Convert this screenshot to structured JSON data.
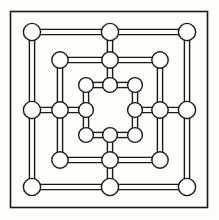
{
  "figure": {
    "background_color": "#fdfdfb",
    "line_color": "#1a1a1a",
    "node_fill_color": "#ffffff",
    "node_stroke_color": "#1a1a1a"
  },
  "frame": {
    "name": "outer-border",
    "x": 10.5,
    "y": 11.5,
    "width": 197,
    "height": 196,
    "stroke_width": 1.6
  },
  "geometry": {
    "stroke_width": 1.4,
    "rail_offset": 2.6,
    "rings": [
      {
        "name": "outer-ring",
        "min": 32,
        "mid": 110,
        "max": 187,
        "node_radius": 8.6
      },
      {
        "name": "middle-ring",
        "min": 60,
        "mid": 110,
        "max": 160,
        "node_radius": 8.2
      },
      {
        "name": "inner-ring",
        "min": 86,
        "mid": 110,
        "max": 135,
        "node_radius": 7.4
      }
    ]
  },
  "nodes": [
    {
      "id": "a1",
      "ring": "outer",
      "position": "top-left",
      "cx": 32,
      "cy": 32,
      "r": 8.6
    },
    {
      "id": "a2",
      "ring": "outer",
      "position": "top-middle",
      "cx": 110,
      "cy": 32,
      "r": 8.6
    },
    {
      "id": "a3",
      "ring": "outer",
      "position": "top-right",
      "cx": 187,
      "cy": 32,
      "r": 8.6
    },
    {
      "id": "a4",
      "ring": "outer",
      "position": "middle-left",
      "cx": 32,
      "cy": 110,
      "r": 8.6
    },
    {
      "id": "a5",
      "ring": "outer",
      "position": "middle-right",
      "cx": 187,
      "cy": 110,
      "r": 8.6
    },
    {
      "id": "a6",
      "ring": "outer",
      "position": "bottom-left",
      "cx": 32,
      "cy": 187,
      "r": 8.6
    },
    {
      "id": "a7",
      "ring": "outer",
      "position": "bottom-middle",
      "cx": 110,
      "cy": 187,
      "r": 8.6
    },
    {
      "id": "a8",
      "ring": "outer",
      "position": "bottom-right",
      "cx": 187,
      "cy": 187,
      "r": 8.6
    },
    {
      "id": "b1",
      "ring": "middle",
      "position": "top-left",
      "cx": 60,
      "cy": 60,
      "r": 8.2
    },
    {
      "id": "b2",
      "ring": "middle",
      "position": "top-middle",
      "cx": 110,
      "cy": 60,
      "r": 8.2
    },
    {
      "id": "b3",
      "ring": "middle",
      "position": "top-right",
      "cx": 160,
      "cy": 60,
      "r": 8.2
    },
    {
      "id": "b4",
      "ring": "middle",
      "position": "middle-left",
      "cx": 60,
      "cy": 110,
      "r": 8.2
    },
    {
      "id": "b5",
      "ring": "middle",
      "position": "middle-right",
      "cx": 160,
      "cy": 110,
      "r": 8.2
    },
    {
      "id": "b6",
      "ring": "middle",
      "position": "bottom-left",
      "cx": 60,
      "cy": 160,
      "r": 8.2
    },
    {
      "id": "b7",
      "ring": "middle",
      "position": "bottom-middle",
      "cx": 110,
      "cy": 160,
      "r": 8.2
    },
    {
      "id": "b8",
      "ring": "middle",
      "position": "bottom-right",
      "cx": 160,
      "cy": 160,
      "r": 8.2
    },
    {
      "id": "c1",
      "ring": "inner",
      "position": "top-left",
      "cx": 86,
      "cy": 85,
      "r": 7.4
    },
    {
      "id": "c2",
      "ring": "inner",
      "position": "top-middle",
      "cx": 110,
      "cy": 85,
      "r": 7.4
    },
    {
      "id": "c3",
      "ring": "inner",
      "position": "top-right",
      "cx": 135,
      "cy": 85,
      "r": 7.4
    },
    {
      "id": "c4",
      "ring": "inner",
      "position": "middle-left",
      "cx": 86,
      "cy": 110,
      "r": 7.4
    },
    {
      "id": "c5",
      "ring": "inner",
      "position": "middle-right",
      "cx": 135,
      "cy": 110,
      "r": 7.4
    },
    {
      "id": "c6",
      "ring": "inner",
      "position": "bottom-left",
      "cx": 86,
      "cy": 135,
      "r": 7.4
    },
    {
      "id": "c7",
      "ring": "inner",
      "position": "bottom-middle",
      "cx": 110,
      "cy": 135,
      "r": 7.4
    },
    {
      "id": "c8",
      "ring": "inner",
      "position": "bottom-right",
      "cx": 135,
      "cy": 135,
      "r": 7.4
    }
  ],
  "edges": [
    {
      "id": "e01",
      "from": "a1",
      "to": "a2",
      "orientation": "horizontal"
    },
    {
      "id": "e02",
      "from": "a2",
      "to": "a3",
      "orientation": "horizontal"
    },
    {
      "id": "e03",
      "from": "a6",
      "to": "a7",
      "orientation": "horizontal"
    },
    {
      "id": "e04",
      "from": "a7",
      "to": "a8",
      "orientation": "horizontal"
    },
    {
      "id": "e05",
      "from": "a1",
      "to": "a4",
      "orientation": "vertical"
    },
    {
      "id": "e06",
      "from": "a4",
      "to": "a6",
      "orientation": "vertical"
    },
    {
      "id": "e07",
      "from": "a3",
      "to": "a5",
      "orientation": "vertical"
    },
    {
      "id": "e08",
      "from": "a5",
      "to": "a8",
      "orientation": "vertical"
    },
    {
      "id": "e09",
      "from": "b1",
      "to": "b2",
      "orientation": "horizontal"
    },
    {
      "id": "e10",
      "from": "b2",
      "to": "b3",
      "orientation": "horizontal"
    },
    {
      "id": "e11",
      "from": "b6",
      "to": "b7",
      "orientation": "horizontal"
    },
    {
      "id": "e12",
      "from": "b7",
      "to": "b8",
      "orientation": "horizontal"
    },
    {
      "id": "e13",
      "from": "b1",
      "to": "b4",
      "orientation": "vertical"
    },
    {
      "id": "e14",
      "from": "b4",
      "to": "b6",
      "orientation": "vertical"
    },
    {
      "id": "e15",
      "from": "b3",
      "to": "b5",
      "orientation": "vertical"
    },
    {
      "id": "e16",
      "from": "b5",
      "to": "b8",
      "orientation": "vertical"
    },
    {
      "id": "e17",
      "from": "c1",
      "to": "c2",
      "orientation": "horizontal"
    },
    {
      "id": "e18",
      "from": "c2",
      "to": "c3",
      "orientation": "horizontal"
    },
    {
      "id": "e19",
      "from": "c6",
      "to": "c7",
      "orientation": "horizontal"
    },
    {
      "id": "e20",
      "from": "c7",
      "to": "c8",
      "orientation": "horizontal"
    },
    {
      "id": "e21",
      "from": "c1",
      "to": "c4",
      "orientation": "vertical"
    },
    {
      "id": "e22",
      "from": "c4",
      "to": "c6",
      "orientation": "vertical"
    },
    {
      "id": "e23",
      "from": "c3",
      "to": "c5",
      "orientation": "vertical"
    },
    {
      "id": "e24",
      "from": "c5",
      "to": "c8",
      "orientation": "vertical"
    },
    {
      "id": "s1",
      "from": "a2",
      "to": "c2",
      "orientation": "vertical",
      "kind": "spoke"
    },
    {
      "id": "s2",
      "from": "a7",
      "to": "c7",
      "orientation": "vertical",
      "kind": "spoke"
    },
    {
      "id": "s3",
      "from": "a4",
      "to": "c4",
      "orientation": "horizontal",
      "kind": "spoke"
    },
    {
      "id": "s4",
      "from": "a5",
      "to": "c5",
      "orientation": "horizontal",
      "kind": "spoke"
    }
  ]
}
